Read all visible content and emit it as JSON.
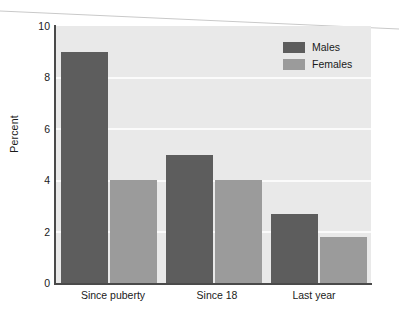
{
  "chart_data": {
    "type": "bar",
    "title": "",
    "subtitle": "",
    "xlabel": "",
    "ylabel": "Percent",
    "categories": [
      "Since puberty",
      "Since 18",
      "Last year"
    ],
    "series": [
      {
        "name": "Males",
        "values": [
          9.0,
          5.0,
          2.7
        ],
        "color": "#5d5d5d"
      },
      {
        "name": "Females",
        "values": [
          4.0,
          4.0,
          1.8
        ],
        "color": "#9b9b9b"
      }
    ],
    "ylim": [
      0,
      10
    ],
    "yticks": [
      0,
      2,
      4,
      6,
      8,
      10
    ],
    "ytick_labels": [
      "0",
      "2",
      "4",
      "6",
      "8",
      "10"
    ],
    "grid": true,
    "grid_axis": "y",
    "grid_color": "#fbfbfb",
    "legend_position": "top-right",
    "plot_background": "#e9e9e9",
    "figure_background": "#ffffff",
    "axis_color": "#4a4a4a",
    "annotations": []
  },
  "legend": {
    "items": [
      {
        "label": "Males",
        "swatch": "males-swatch"
      },
      {
        "label": "Females",
        "swatch": "females-swatch"
      }
    ]
  },
  "axes": {
    "y_title": "Percent",
    "y_tick_labels": [
      "10",
      "8",
      "6",
      "4",
      "2",
      "0"
    ],
    "x_tick_labels": [
      "Since puberty",
      "Since 18",
      "Last year"
    ]
  }
}
